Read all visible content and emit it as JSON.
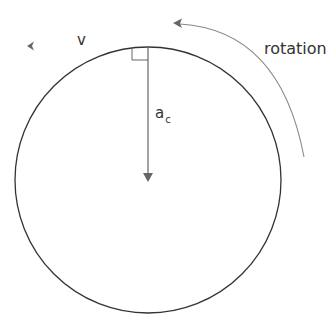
{
  "diagram": {
    "labels": {
      "velocity": "v",
      "acceleration_main": "a",
      "acceleration_sub": "c",
      "rotation": "rotation"
    },
    "colors": {
      "circle": "#333333",
      "arrow": "#666666",
      "rotation_arc": "#888888",
      "text": "#333333"
    }
  }
}
